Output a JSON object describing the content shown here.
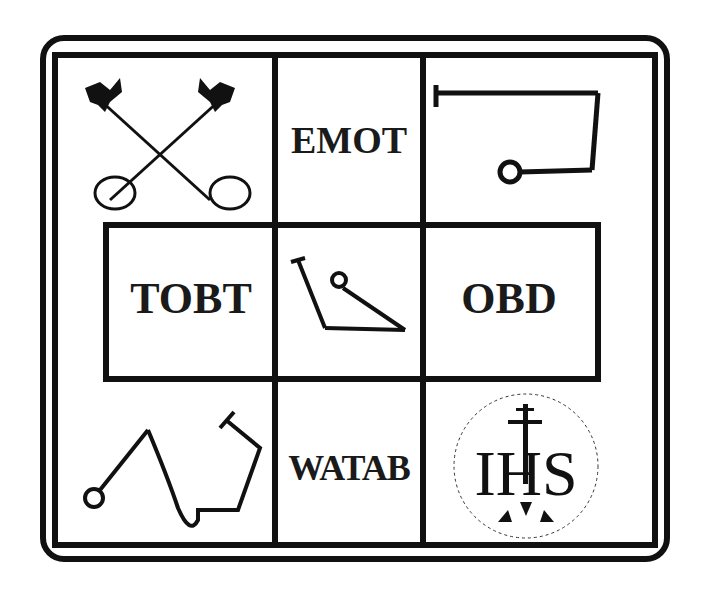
{
  "diagram": {
    "type": "3x3 symbol grid",
    "cells": [
      {
        "row": 0,
        "col": 0,
        "kind": "symbol",
        "symbol": "crossed-keys"
      },
      {
        "row": 0,
        "col": 1,
        "kind": "text",
        "text": "EMOT"
      },
      {
        "row": 0,
        "col": 2,
        "kind": "symbol",
        "symbol": "path-line-with-circle"
      },
      {
        "row": 1,
        "col": 0,
        "kind": "text",
        "text": "TOBT"
      },
      {
        "row": 1,
        "col": 1,
        "kind": "symbol",
        "symbol": "path-triangle-with-circle"
      },
      {
        "row": 1,
        "col": 2,
        "kind": "text",
        "text": "OBD"
      },
      {
        "row": 2,
        "col": 0,
        "kind": "symbol",
        "symbol": "path-wave-with-circle"
      },
      {
        "row": 2,
        "col": 1,
        "kind": "text",
        "text": "WATAB"
      },
      {
        "row": 2,
        "col": 2,
        "kind": "symbol",
        "symbol": "ihs-christogram"
      }
    ],
    "labels": {
      "emot": "EMOT",
      "tobt": "TOBT",
      "obd": "OBD",
      "watab": "WATAB",
      "ihs": "IHS"
    },
    "colors": {
      "ink": "#111111",
      "background": "#ffffff"
    }
  }
}
